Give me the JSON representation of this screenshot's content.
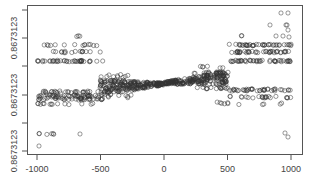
{
  "chart_data": {
    "type": "scatter",
    "title": "",
    "xlabel": "",
    "ylabel": "",
    "xlim": [
      -1040,
      1090
    ],
    "x_ticks": [
      -1000,
      -500,
      0,
      500,
      1000
    ],
    "x_tick_labels": [
      "-1000",
      "-500",
      "0",
      "500",
      "1000"
    ],
    "y_ticks_count": 6,
    "y_tick_labels": [
      "0.8673123",
      "0.8673123",
      "0.8673123"
    ],
    "y_tick_label_positions": "every other tick (2nd, 4th, 6th from top)",
    "grid": false,
    "legend": null,
    "marker": "open circle",
    "marker_color": "#333333",
    "bands": [
      {
        "x_range": [
          -1000,
          -500
        ],
        "y_px": [
          36,
          45,
          52,
          61
        ],
        "density": [
          "sparse",
          "medium",
          "medium",
          "dense"
        ]
      },
      {
        "x_range": [
          -1000,
          -500
        ],
        "y_px": [
          92,
          96,
          99,
          104
        ],
        "density": [
          "medium",
          "dense",
          "dense",
          "sparse"
        ]
      },
      {
        "x_range": [
          -1000,
          -1000
        ],
        "y_px": [
          134,
          146
        ],
        "density": [
          "sparse",
          "single"
        ]
      },
      {
        "x_range": [
          -500,
          0
        ],
        "y_px": [
          76,
          81,
          88
        ],
        "density": [
          "sparse",
          "dense",
          "dense"
        ]
      },
      {
        "x_range": [
          0,
          500
        ],
        "y_px": [
          73,
          78,
          84
        ],
        "density": [
          "dense",
          "dense",
          "medium"
        ]
      },
      {
        "x_range": [
          500,
          1000
        ],
        "y_px": [
          45,
          52,
          61
        ],
        "density": [
          "dense",
          "dense",
          "dense"
        ]
      },
      {
        "x_range": [
          500,
          1000
        ],
        "y_px": [
          90,
          97
        ],
        "density": [
          "dense",
          "medium"
        ]
      },
      {
        "x_range": [
          950,
          1000
        ],
        "y_px": [
          13,
          25,
          137
        ],
        "density": [
          "sparse",
          "sparse",
          "sparse"
        ]
      }
    ]
  },
  "axes": {
    "x_tick_labels": [
      "-1000",
      "-500",
      "0",
      "500",
      "1000"
    ],
    "y_tick_labels": [
      "0.8673123",
      "0.8673123",
      "0.8673123"
    ]
  }
}
